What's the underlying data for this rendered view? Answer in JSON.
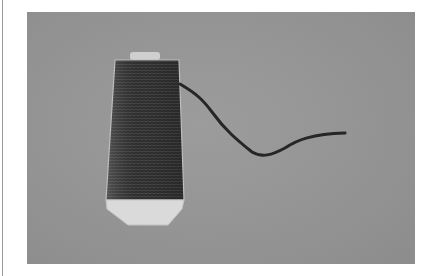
{
  "image": {
    "description": "Photograph of a cone of dark thread with a loose strand trailing to the right, on a gray background",
    "colors": {
      "background": "#ffffff",
      "photo_background": "#949494",
      "thread": "#2a2a2a",
      "spool_base": "#dcdcdc",
      "border_rule": "#9a9a9a"
    }
  }
}
